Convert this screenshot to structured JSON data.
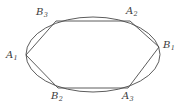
{
  "figure": {
    "background_color": "#ffffff",
    "stroke_color": "#4a4a4a",
    "label_color": "#3b3b3b",
    "width": 183,
    "height": 109,
    "ellipse": {
      "center_x": 93,
      "center_y": 54.5,
      "radius_x": 67,
      "radius_y": 37.5
    },
    "vertices": [
      {
        "id": "A1",
        "letter": "A",
        "subscript": "1",
        "x": 26,
        "y": 55,
        "label_x": 6,
        "label_y": 50
      },
      {
        "id": "B3",
        "letter": "B",
        "subscript": "3",
        "x": 56,
        "y": 21,
        "label_x": 36,
        "label_y": 7
      },
      {
        "id": "A2",
        "letter": "A",
        "subscript": "2",
        "x": 130,
        "y": 21,
        "label_x": 126,
        "label_y": 6
      },
      {
        "id": "B1",
        "letter": "B",
        "subscript": "1",
        "x": 159,
        "y": 47,
        "label_x": 163,
        "label_y": 40
      },
      {
        "id": "A3",
        "letter": "A",
        "subscript": "3",
        "x": 128,
        "y": 88,
        "label_x": 122,
        "label_y": 91
      },
      {
        "id": "B2",
        "letter": "B",
        "subscript": "2",
        "x": 58,
        "y": 88,
        "label_x": 51,
        "label_y": 91
      }
    ],
    "edges": [
      {
        "from": "A1",
        "to": "B3"
      },
      {
        "from": "B3",
        "to": "A2"
      },
      {
        "from": "A2",
        "to": "B1"
      },
      {
        "from": "B1",
        "to": "A3"
      },
      {
        "from": "A3",
        "to": "B2"
      },
      {
        "from": "B2",
        "to": "A1"
      }
    ]
  }
}
